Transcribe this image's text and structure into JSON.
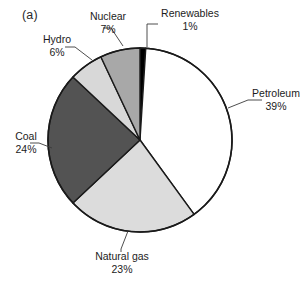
{
  "figure": {
    "panel_label": "(a)",
    "background": "#ffffff"
  },
  "chart_data": {
    "type": "pie",
    "title": "",
    "subtitle": "",
    "xlabel": "",
    "ylabel": "",
    "legend_position": "none",
    "grid": false,
    "units": "percent",
    "start_angle_deg": 0,
    "direction": "clockwise",
    "center": {
      "x": 140,
      "y": 140
    },
    "radius": 92,
    "categories": [
      "Renewables",
      "Petroleum",
      "Natural gas",
      "Coal",
      "Hydro",
      "Nuclear"
    ],
    "values": [
      1,
      39,
      23,
      24,
      6,
      7
    ],
    "labels": [
      "Renewables",
      "Petroleum",
      "Natural gas",
      "Coal",
      "Hydro",
      "Nuclear"
    ],
    "value_labels": [
      "1%",
      "39%",
      "23%",
      "24%",
      "6%",
      "7%"
    ],
    "colors": [
      "#000000",
      "#ffffff",
      "#dcdcdc",
      "#535353",
      "#d8d8d8",
      "#a8a8a8"
    ],
    "stroke": "#1a1a1a",
    "slices": [
      {
        "name": "Renewables",
        "value": 1,
        "value_label": "1%",
        "color": "#000000",
        "start_deg": 0,
        "end_deg": 3.6
      },
      {
        "name": "Petroleum",
        "value": 39,
        "value_label": "39%",
        "color": "#ffffff",
        "start_deg": 3.6,
        "end_deg": 144.0
      },
      {
        "name": "Natural gas",
        "value": 23,
        "value_label": "23%",
        "color": "#dcdcdc",
        "start_deg": 144.0,
        "end_deg": 226.8
      },
      {
        "name": "Coal",
        "value": 24,
        "value_label": "24%",
        "color": "#535353",
        "start_deg": 226.8,
        "end_deg": 313.2
      },
      {
        "name": "Hydro",
        "value": 6,
        "value_label": "6%",
        "color": "#d8d8d8",
        "start_deg": 313.2,
        "end_deg": 334.8
      },
      {
        "name": "Nuclear",
        "value": 7,
        "value_label": "7%",
        "color": "#a8a8a8",
        "start_deg": 334.8,
        "end_deg": 360.0
      }
    ]
  },
  "callouts": {
    "nuclear": {
      "name": "Nuclear",
      "pct": "7%"
    },
    "renewables": {
      "name": "Renewables",
      "pct": "1%"
    },
    "hydro": {
      "name": "Hydro",
      "pct": "6%"
    },
    "petroleum": {
      "name": "Petroleum",
      "pct": "39%"
    },
    "coal": {
      "name": "Coal",
      "pct": "24%"
    },
    "natural_gas": {
      "name": "Natural gas",
      "pct": "23%"
    }
  }
}
